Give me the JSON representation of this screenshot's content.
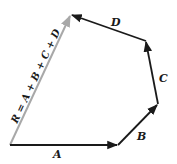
{
  "diagram": {
    "colors": {
      "vector": "#1a1a1a",
      "resultant": "#a8a8a8",
      "background": "#ffffff"
    },
    "vectors": [
      {
        "name": "A",
        "label": "A",
        "from": [
          10,
          145
        ],
        "to": [
          118,
          145
        ]
      },
      {
        "name": "B",
        "label": "B",
        "from": [
          118,
          145
        ],
        "to": [
          158,
          104
        ]
      },
      {
        "name": "C",
        "label": "C",
        "from": [
          158,
          104
        ],
        "to": [
          146,
          41
        ]
      },
      {
        "name": "D",
        "label": "D",
        "from": [
          146,
          41
        ],
        "to": [
          71,
          15
        ]
      }
    ],
    "resultant": {
      "name": "R",
      "label": "R = A + B + C + D",
      "from": [
        10,
        145
      ],
      "to": [
        71,
        15
      ]
    }
  }
}
